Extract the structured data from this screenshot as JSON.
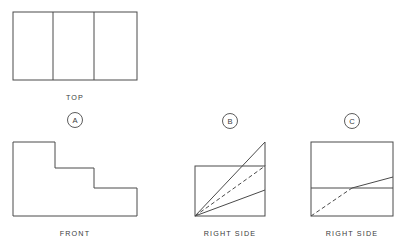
{
  "drawing": {
    "title": "Orthographic Projection Exercise",
    "stroke_color": "#4a4a4a",
    "text_color": "#3b3b3b",
    "background_color": "#ffffff"
  },
  "views": {
    "top": {
      "label": "TOP",
      "label_x": 75,
      "label_y": 98,
      "rect": {
        "x": 13,
        "y": 12,
        "width": 124,
        "height": 68
      },
      "dividers": [
        53,
        94
      ]
    },
    "front": {
      "label": "FRONT",
      "label_x": 75,
      "label_y": 234,
      "outline": [
        [
          13,
          142
        ],
        [
          55,
          142
        ],
        [
          55,
          168
        ],
        [
          94,
          168
        ],
        [
          94,
          188
        ],
        [
          137,
          188
        ],
        [
          137,
          216
        ],
        [
          13,
          216
        ]
      ],
      "steps": [
        {
          "name": "tall-left-step",
          "x": 13,
          "top": 142,
          "width": 42
        },
        {
          "name": "middle-step",
          "x": 55,
          "top": 168,
          "width": 39
        },
        {
          "name": "short-right-step",
          "x": 94,
          "top": 188,
          "width": 43
        }
      ]
    }
  },
  "choices": [
    {
      "id": "a",
      "marker_letter": "A",
      "marker_x": 75,
      "marker_y": 120,
      "marker_radius": 7.5,
      "caption": "",
      "has_view": false
    },
    {
      "id": "b",
      "marker_letter": "B",
      "marker_x": 230,
      "marker_y": 121,
      "marker_radius": 7.5,
      "caption": "RIGHT SIDE",
      "caption_x": 230,
      "caption_y": 234,
      "has_view": true,
      "rect": {
        "x": 195,
        "y": 166,
        "width": 70,
        "height": 50
      },
      "apex": {
        "x": 265,
        "y": 142
      },
      "solid_lines": [
        {
          "name": "triangle-hypotenuse",
          "x1": 195,
          "y1": 216,
          "x2": 265,
          "y2": 142
        },
        {
          "name": "triangle-right-edge",
          "x1": 265,
          "y1": 142,
          "x2": 265,
          "y2": 166
        },
        {
          "name": "lower-diagonal",
          "x1": 195,
          "y1": 216,
          "x2": 265,
          "y2": 190
        }
      ],
      "dashed_lines": [
        {
          "name": "hidden-diagonal",
          "x1": 195,
          "y1": 216,
          "x2": 265,
          "y2": 166
        }
      ]
    },
    {
      "id": "c",
      "marker_letter": "C",
      "marker_x": 352,
      "marker_y": 121,
      "marker_radius": 7.5,
      "caption": "RIGHT SIDE",
      "caption_x": 352,
      "caption_y": 234,
      "has_view": true,
      "rect": {
        "x": 311,
        "y": 142,
        "width": 82,
        "height": 74
      },
      "midline_y": 188,
      "solid_lines": [
        {
          "name": "upper-diagonal",
          "x1": 352,
          "y1": 188,
          "x2": 393,
          "y2": 177
        }
      ],
      "dashed_lines": [
        {
          "name": "hidden-diagonal",
          "x1": 311,
          "y1": 216,
          "x2": 352,
          "y2": 188
        }
      ]
    }
  ]
}
